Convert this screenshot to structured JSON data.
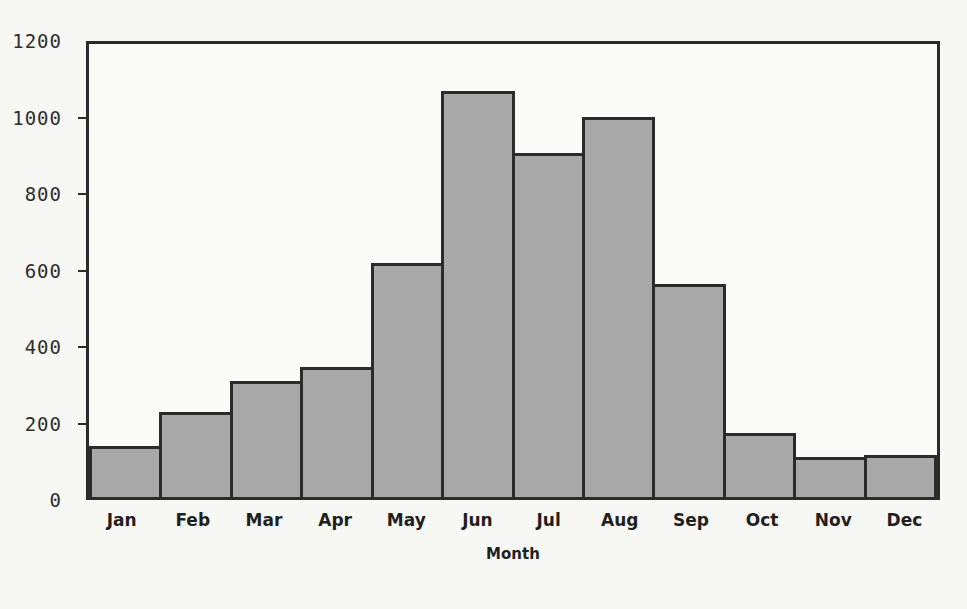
{
  "chart_data": {
    "type": "bar",
    "title": "",
    "subtitle": "",
    "xlabel": "Month",
    "ylabel": "",
    "categories": [
      "Jan",
      "Feb",
      "Mar",
      "Apr",
      "May",
      "Jun",
      "Jul",
      "Aug",
      "Sep",
      "Oct",
      "Nov",
      "Dec"
    ],
    "values": [
      135,
      225,
      308,
      345,
      620,
      1075,
      910,
      1007,
      565,
      170,
      105,
      110
    ],
    "ylim": [
      0,
      1200
    ],
    "yticks": [
      0,
      200,
      400,
      600,
      800,
      1000,
      1200
    ],
    "ytick_labels": [
      "0",
      "200",
      "400",
      "600",
      "800",
      "1000",
      "1200"
    ],
    "grid": false,
    "legend": null,
    "legend_position": "none",
    "bar_fill_color": "#a9a9a9",
    "bar_edge_color": "#2b2b2b",
    "axis_color": "#2b2b2b",
    "background_color": "#f7f7f4",
    "plot_background_color": "#fbfbf9"
  }
}
